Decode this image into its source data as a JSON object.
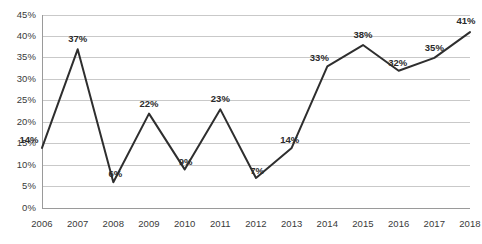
{
  "chart_data": {
    "type": "line",
    "title": "",
    "subtitle": "",
    "xlabel": "",
    "ylabel": "",
    "categories": [
      "2006",
      "2007",
      "2008",
      "2009",
      "2010",
      "2011",
      "2012",
      "2013",
      "2014",
      "2015",
      "2016",
      "2017",
      "2018"
    ],
    "values": [
      14,
      37,
      6,
      22,
      9,
      23,
      7,
      14,
      33,
      38,
      32,
      35,
      41
    ],
    "point_labels": [
      "14%",
      "37%",
      "6%",
      "22%",
      "9%",
      "23%",
      "7%",
      "14%",
      "33%",
      "38%",
      "32%",
      "35%",
      "41%"
    ],
    "ylim": [
      0,
      45
    ],
    "ytick_values": [
      0,
      5,
      10,
      15,
      20,
      25,
      30,
      35,
      40,
      45
    ],
    "ytick_labels": [
      "0%",
      "5%",
      "10%",
      "15%",
      "20%",
      "25%",
      "30%",
      "35%",
      "40%",
      "45%"
    ],
    "grid": true,
    "grid_axis": "y",
    "legend": false,
    "legend_position": "none",
    "markers": false,
    "series": [
      {
        "name": "",
        "values": [
          14,
          37,
          6,
          22,
          9,
          23,
          7,
          14,
          33,
          38,
          32,
          35,
          41
        ]
      }
    ],
    "colors": {
      "line": "#2e2e2e",
      "grid": "#c9c9c9",
      "axis": "#9a9a9a",
      "tick_text": "#3a3a3a",
      "label_text": "#2b2b2b",
      "background": "#ffffff"
    }
  }
}
